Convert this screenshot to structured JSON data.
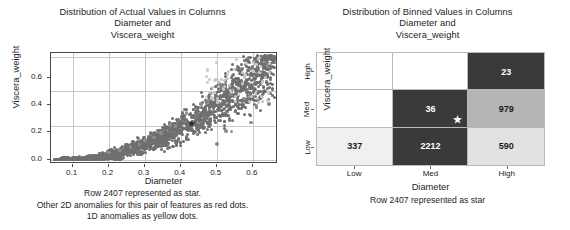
{
  "figure": {
    "background": "#ffffff",
    "panels": 2
  },
  "left_panel": {
    "title_lines": [
      "Distribution of Actual Values in Columns",
      "Diameter and",
      "Viscera_weight"
    ],
    "caption_lines": [
      "Row 2407 represented as star.",
      "Other 2D anomalies for this pair of features as red dots.",
      "1D anomalies as yellow dots."
    ],
    "marker_legend": {
      "normal_dots": "gray dots",
      "anomaly_2d_dots": "red dots",
      "anomaly_1d_dots": "yellow dots",
      "highlight_row": "Row 2407 star"
    }
  },
  "right_panel": {
    "title_lines": [
      "Distribution of Binned Values in Columns",
      "Diameter and",
      "Viscera_weight"
    ],
    "caption_lines": [
      "Row 2407 represented as star"
    ]
  },
  "chart_data": [
    {
      "type": "scatter",
      "title": "Distribution of Actual Values in Columns Diameter and Viscera_weight",
      "xlabel": "Diameter",
      "ylabel": "Viscera_weight",
      "xlim": [
        0.04,
        0.67
      ],
      "ylim": [
        -0.03,
        0.78
      ],
      "xticks": [
        0.1,
        0.2,
        0.3,
        0.4,
        0.5,
        0.6
      ],
      "xticklabels": [
        "0.1",
        "0.2",
        "0.3",
        "0.4",
        "0.5",
        "0.6"
      ],
      "yticks": [
        0.0,
        0.2,
        0.4,
        0.6
      ],
      "yticklabels": [
        "0.0",
        "0.2",
        "0.4",
        "0.6"
      ],
      "grid": true,
      "highlight_point": {
        "label": "Row 2407",
        "x": 0.43,
        "y": 0.26,
        "marker": "star"
      },
      "series": [
        {
          "name": "normal",
          "color": "#6f6f6f",
          "marker": "circle",
          "points": [
            [
              0.055,
              0.002
            ],
            [
              0.09,
              0.004
            ],
            [
              0.105,
              0.006
            ],
            [
              0.115,
              0.007
            ],
            [
              0.125,
              0.009
            ],
            [
              0.13,
              0.012
            ],
            [
              0.135,
              0.01
            ],
            [
              0.14,
              0.013
            ],
            [
              0.145,
              0.012
            ],
            [
              0.15,
              0.016
            ],
            [
              0.155,
              0.014
            ],
            [
              0.16,
              0.018
            ],
            [
              0.165,
              0.02
            ],
            [
              0.17,
              0.019
            ],
            [
              0.175,
              0.022
            ],
            [
              0.18,
              0.024
            ],
            [
              0.185,
              0.021
            ],
            [
              0.19,
              0.026
            ],
            [
              0.195,
              0.028
            ],
            [
              0.2,
              0.03
            ],
            [
              0.205,
              0.027
            ],
            [
              0.21,
              0.033
            ],
            [
              0.215,
              0.031
            ],
            [
              0.22,
              0.036
            ],
            [
              0.225,
              0.034
            ],
            [
              0.23,
              0.04
            ],
            [
              0.235,
              0.038
            ],
            [
              0.24,
              0.044
            ],
            [
              0.245,
              0.041
            ],
            [
              0.25,
              0.048
            ],
            [
              0.255,
              0.052
            ],
            [
              0.26,
              0.046
            ],
            [
              0.265,
              0.056
            ],
            [
              0.27,
              0.06
            ],
            [
              0.275,
              0.054
            ],
            [
              0.28,
              0.065
            ],
            [
              0.285,
              0.062
            ],
            [
              0.29,
              0.07
            ],
            [
              0.295,
              0.068
            ],
            [
              0.3,
              0.075
            ],
            [
              0.305,
              0.072
            ],
            [
              0.31,
              0.082
            ],
            [
              0.315,
              0.078
            ],
            [
              0.32,
              0.088
            ],
            [
              0.325,
              0.085
            ],
            [
              0.33,
              0.095
            ],
            [
              0.335,
              0.09
            ],
            [
              0.34,
              0.1
            ],
            [
              0.345,
              0.098
            ],
            [
              0.35,
              0.108
            ],
            [
              0.355,
              0.104
            ],
            [
              0.36,
              0.115
            ],
            [
              0.365,
              0.11
            ],
            [
              0.37,
              0.122
            ],
            [
              0.375,
              0.118
            ],
            [
              0.38,
              0.13
            ],
            [
              0.385,
              0.125
            ],
            [
              0.39,
              0.138
            ],
            [
              0.395,
              0.133
            ],
            [
              0.4,
              0.145
            ],
            [
              0.405,
              0.14
            ],
            [
              0.41,
              0.152
            ],
            [
              0.415,
              0.148
            ],
            [
              0.42,
              0.16
            ],
            [
              0.425,
              0.155
            ],
            [
              0.43,
              0.168
            ],
            [
              0.435,
              0.163
            ],
            [
              0.44,
              0.176
            ],
            [
              0.445,
              0.17
            ],
            [
              0.45,
              0.185
            ],
            [
              0.455,
              0.18
            ],
            [
              0.46,
              0.195
            ],
            [
              0.465,
              0.19
            ],
            [
              0.47,
              0.205
            ],
            [
              0.475,
              0.2
            ],
            [
              0.48,
              0.215
            ],
            [
              0.485,
              0.21
            ],
            [
              0.49,
              0.225
            ],
            [
              0.495,
              0.22
            ],
            [
              0.5,
              0.235
            ],
            [
              0.505,
              0.23
            ],
            [
              0.51,
              0.245
            ],
            [
              0.515,
              0.24
            ],
            [
              0.52,
              0.258
            ],
            [
              0.525,
              0.252
            ],
            [
              0.53,
              0.268
            ],
            [
              0.535,
              0.262
            ],
            [
              0.54,
              0.28
            ],
            [
              0.545,
              0.272
            ],
            [
              0.55,
              0.29
            ],
            [
              0.555,
              0.285
            ],
            [
              0.56,
              0.3
            ],
            [
              0.565,
              0.295
            ],
            [
              0.57,
              0.312
            ],
            [
              0.575,
              0.305
            ],
            [
              0.58,
              0.322
            ],
            [
              0.585,
              0.316
            ],
            [
              0.59,
              0.332
            ],
            [
              0.595,
              0.326
            ],
            [
              0.6,
              0.345
            ],
            [
              0.605,
              0.338
            ],
            [
              0.61,
              0.355
            ],
            [
              0.615,
              0.348
            ],
            [
              0.62,
              0.365
            ],
            [
              0.625,
              0.358
            ],
            [
              0.63,
              0.378
            ],
            [
              0.635,
              0.37
            ],
            [
              0.64,
              0.39
            ],
            [
              0.645,
              0.382
            ],
            [
              0.65,
              0.4
            ],
            [
              0.655,
              0.394
            ],
            [
              0.66,
              0.41
            ]
          ]
        },
        {
          "name": "2D anomalies",
          "color": "#8d8d8d",
          "marker": "circle",
          "note": "red dots (desaturated in image)"
        },
        {
          "name": "1D anomalies",
          "color": "#c9c9c9",
          "marker": "circle",
          "note": "yellow dots (desaturated in image)"
        }
      ]
    },
    {
      "type": "heatmap",
      "title": "Distribution of Binned Values in Columns Diameter and Viscera_weight",
      "xlabel": "Diameter",
      "ylabel": "Viscera_weight",
      "x_categories": [
        "Low",
        "Med",
        "High"
      ],
      "y_categories": [
        "Low",
        "Med",
        "High"
      ],
      "rows_top_to_bottom": [
        "High",
        "Med",
        "Low"
      ],
      "cells": [
        {
          "row": "High",
          "col": "Low",
          "value": null,
          "text": "",
          "fill": "#ffffff",
          "text_color": "#1a1a1a"
        },
        {
          "row": "High",
          "col": "Med",
          "value": null,
          "text": "",
          "fill": "#ffffff",
          "text_color": "#1a1a1a"
        },
        {
          "row": "High",
          "col": "High",
          "value": 23,
          "text": "23",
          "fill": "#3a3a3a",
          "text_color": "#ffffff"
        },
        {
          "row": "Med",
          "col": "Low",
          "value": null,
          "text": "",
          "fill": "#ffffff",
          "text_color": "#1a1a1a"
        },
        {
          "row": "Med",
          "col": "Med",
          "value": 36,
          "text": "36",
          "fill": "#3a3a3a",
          "text_color": "#ffffff"
        },
        {
          "row": "Med",
          "col": "High",
          "value": 979,
          "text": "979",
          "fill": "#b5b5b5",
          "text_color": "#1a1a1a"
        },
        {
          "row": "Low",
          "col": "Low",
          "value": 337,
          "text": "337",
          "fill": "#f0f0f0",
          "text_color": "#1a1a1a"
        },
        {
          "row": "Low",
          "col": "Med",
          "value": 2212,
          "text": "2212",
          "fill": "#3a3a3a",
          "text_color": "#ffffff"
        },
        {
          "row": "Low",
          "col": "High",
          "value": 590,
          "text": "590",
          "fill": "#e2e2e2",
          "text_color": "#1a1a1a"
        }
      ],
      "highlight_point": {
        "label": "Row 2407",
        "row": "Med",
        "col": "Med",
        "marker": "star",
        "color": "#ffffff"
      }
    }
  ],
  "scatter_axes": {
    "xticklabels": [
      "0.1",
      "0.2",
      "0.3",
      "0.4",
      "0.5",
      "0.6"
    ],
    "yticklabels": [
      "0.0",
      "0.2",
      "0.4",
      "0.6"
    ],
    "xlabel": "Diameter",
    "ylabel": "Viscera_weight"
  },
  "heat_axes": {
    "xticklabels": [
      "Low",
      "Med",
      "High"
    ],
    "yticklabels": [
      "Low",
      "Med",
      "High"
    ],
    "xlabel": "Diameter",
    "ylabel": "Viscera_weight"
  },
  "glyphs": {
    "star": "★"
  }
}
